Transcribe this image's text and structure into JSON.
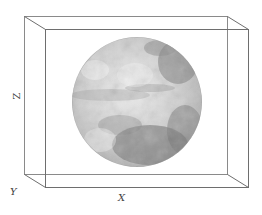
{
  "figure": {
    "type": "3d-bounding-box-with-sphere",
    "axes": {
      "x_label": "X",
      "y_label": "Y",
      "z_label": "Z"
    },
    "colors": {
      "box_edge": "#7a7a7a",
      "background": "#ffffff",
      "sphere_light": "#e8e8e8",
      "sphere_mid": "#b5b5b5",
      "sphere_dark": "#6e6e6e"
    },
    "box": {
      "back": {
        "x1": 24,
        "y1": 16,
        "x2": 227,
        "y2": 174
      },
      "front": {
        "x1": 45,
        "y1": 29,
        "x2": 248,
        "y2": 187
      }
    },
    "sphere": {
      "cx": 137,
      "cy": 102,
      "r": 65,
      "texture": "grayscale planetary surface"
    }
  }
}
